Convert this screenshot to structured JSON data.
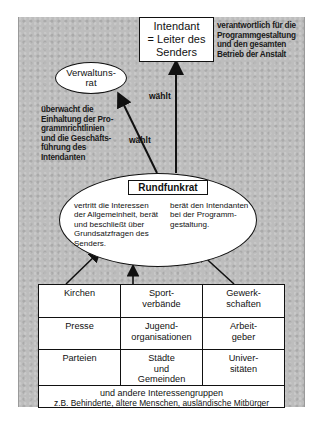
{
  "diagram": {
    "intendant": {
      "line1": "Intendant",
      "line2": "= Leiter des",
      "line3": "Senders"
    },
    "intendant_note": {
      "line1": "verantwortlich für die",
      "line2": "Programmgestaltung",
      "line3": "und den gesamten",
      "line4": "Betrieb der Anstalt"
    },
    "verwaltungsrat": {
      "line1": "Verwaltuns-",
      "line2": "rat"
    },
    "verwaltungsrat_note": {
      "line1": "überwacht die",
      "line2": "Einhaltung der Pro-",
      "line3": "grammrichtlinien",
      "line4": "und die Geschäfts-",
      "line5": "führung des",
      "line6": "Intendanten"
    },
    "arrow_labels": {
      "to_intendant": "wählt",
      "to_verwaltungsrat": "wählt"
    },
    "rundfunkrat": {
      "title": "Rundfunkrat",
      "left": {
        "line1": "vertritt die Interessen",
        "line2": "der Allgemeinheit, berät",
        "line3": "und beschließt über",
        "line4": "Grundsatzfragen des",
        "line5": "Senders."
      },
      "right": {
        "line1": "berät den Intendanten",
        "line2": "bei der Programm-",
        "line3": "gestaltung."
      }
    },
    "groups": {
      "rows": [
        [
          {
            "line1": "Kirchen",
            "line2": ""
          },
          {
            "line1": "Sport-",
            "line2": "verbände"
          },
          {
            "line1": "Gewerk-",
            "line2": "schaften"
          }
        ],
        [
          {
            "line1": "Presse",
            "line2": ""
          },
          {
            "line1": "Jugend-",
            "line2": "organisationen"
          },
          {
            "line1": "Arbeit-",
            "line2": "geber"
          }
        ],
        [
          {
            "line1": "Parteien",
            "line2": "",
            "line3": ""
          },
          {
            "line1": "Städte",
            "line2": "und",
            "line3": "Gemeinden"
          },
          {
            "line1": "Univer-",
            "line2": "sitäten",
            "line3": ""
          }
        ]
      ],
      "footer": {
        "line1": "und andere Interessengruppen",
        "line2": "z.B. Behinderte, ältere Menschen, ausländische Mitbürger"
      }
    }
  }
}
